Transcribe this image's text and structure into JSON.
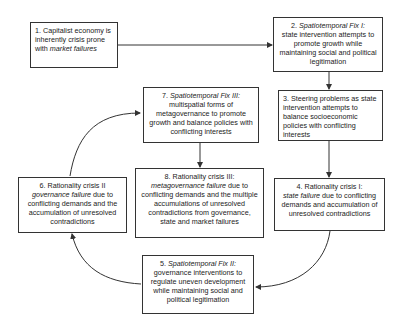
{
  "diagram": {
    "type": "cyclical flow diagram",
    "boxes": [
      {
        "id": 1,
        "num": "1.",
        "lead": "Capitalist economy is inherently crisis prone with ",
        "italic": "market failures",
        "rest": ""
      },
      {
        "id": 2,
        "num": "2.",
        "italic": "Spatiotemporal Fix I:",
        "rest": "state intervention attempts to promote growth while maintaining social and political legitimation"
      },
      {
        "id": 3,
        "num": "3.",
        "text": "Steering problems as state intervention attempts to balance socioeconomic policies with conflicting interests"
      },
      {
        "id": 4,
        "num": "4.",
        "lead": "Rationality crisis I:",
        "italic": "state failure",
        "rest": "due to conflicting demands and accumulation of unresolved contradictions"
      },
      {
        "id": 5,
        "num": "5.",
        "italic": "Spatiotemporal Fix II:",
        "rest": "governance interventions to regulate uneven development while maintaining social and political legitimation"
      },
      {
        "id": 6,
        "num": "6.",
        "lead": "Rationality crisis II",
        "italic": "governance failure",
        "rest": "due to conflicting demands and the accumulation of unresolved contradictions"
      },
      {
        "id": 7,
        "num": "7.",
        "italic": "Spatiotemporal Fix III:",
        "rest": "multispatial forms of metagovernance to promote growth and balance policies with conflicting interests"
      },
      {
        "id": 8,
        "num": "8.",
        "lead": "Rationality crisis III:",
        "italic": "metagovernance failure",
        "rest": "due to conflicting demands and the multiple accumulations of unresolved contradictions from governance, state and market failures"
      }
    ],
    "edges": [
      {
        "from": 1,
        "to": 2
      },
      {
        "from": 2,
        "to": 3
      },
      {
        "from": 3,
        "to": 4
      },
      {
        "from": 4,
        "to": 5
      },
      {
        "from": 5,
        "to": 6
      },
      {
        "from": 6,
        "to": 7
      },
      {
        "from": 7,
        "to": 8
      }
    ]
  }
}
